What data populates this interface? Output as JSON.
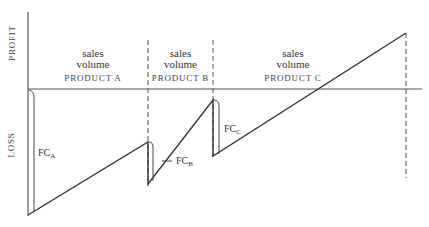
{
  "axes": {
    "y_top_label": "PROFIT",
    "y_bottom_label": "LOSS"
  },
  "segments": [
    {
      "id": "A",
      "line1": "sales",
      "line2": "volume",
      "product": "PRODUCT A",
      "fixed_cost_label": "FC",
      "fixed_cost_sub": "A"
    },
    {
      "id": "B",
      "line1": "sales",
      "line2": "volume",
      "product": "PRODUCT B",
      "fixed_cost_label": "FC",
      "fixed_cost_sub": "B"
    },
    {
      "id": "C",
      "line1": "sales",
      "line2": "volume",
      "product": "PRODUCT C",
      "fixed_cost_label": "FC",
      "fixed_cost_sub": "C"
    }
  ],
  "colors": {
    "line": "#333333",
    "axis": "#555555",
    "dash": "#555555"
  }
}
